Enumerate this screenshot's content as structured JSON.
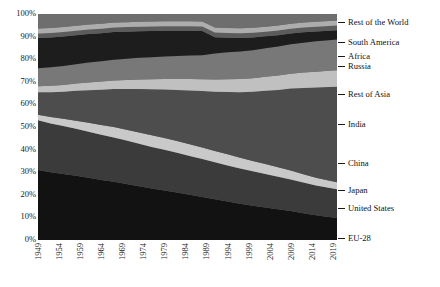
{
  "chart_data": {
    "type": "area",
    "title": "",
    "xlabel": "",
    "ylabel": "",
    "stacked": true,
    "normalized": true,
    "grid": false,
    "legend_position": "right-outside",
    "xlim": [
      1949,
      2020
    ],
    "ylim": [
      0,
      100
    ],
    "ytick_labels": [
      "100%",
      "90%",
      "80%",
      "70%",
      "60%",
      "50%",
      "40%",
      "30%",
      "20%",
      "10%",
      "0%"
    ],
    "ytick_values": [
      100,
      90,
      80,
      70,
      60,
      50,
      40,
      30,
      20,
      10,
      0
    ],
    "xtick_labels": [
      "1949",
      "1954",
      "1959",
      "1964",
      "1969",
      "1974",
      "1979",
      "1984",
      "1989",
      "1994",
      "1999",
      "2004",
      "2009",
      "2014",
      "2019"
    ],
    "xtick_values": [
      1949,
      1954,
      1959,
      1964,
      1969,
      1974,
      1979,
      1984,
      1989,
      1994,
      1999,
      2004,
      2009,
      2014,
      2019
    ],
    "x": [
      1949,
      1952,
      1955,
      1958,
      1961,
      1964,
      1967,
      1970,
      1973,
      1976,
      1979,
      1982,
      1985,
      1988,
      1991,
      1994,
      1997,
      2000,
      2003,
      2006,
      2009,
      2012,
      2015,
      2018,
      2020
    ],
    "series": [
      {
        "name": "EU-28",
        "color": "#121212",
        "legend_y": 238,
        "values": [
          31.0,
          30.0,
          29.2,
          28.4,
          27.5,
          26.6,
          25.8,
          24.8,
          23.8,
          22.8,
          21.9,
          21.0,
          20.0,
          19.0,
          18.0,
          17.0,
          16.0,
          15.2,
          14.4,
          13.6,
          12.8,
          11.8,
          10.9,
          10.2,
          9.8
        ]
      },
      {
        "name": "United States",
        "color": "#3b3b3b",
        "legend_y": 208,
        "values": [
          22.0,
          21.6,
          21.2,
          20.8,
          20.4,
          20.0,
          19.6,
          19.2,
          18.8,
          18.4,
          18.0,
          17.6,
          17.2,
          16.8,
          16.4,
          16.0,
          15.6,
          15.2,
          14.8,
          14.4,
          14.0,
          13.6,
          13.2,
          12.9,
          12.7
        ]
      },
      {
        "name": "Japan",
        "color": "#c9c9c9",
        "legend_y": 190,
        "values": [
          2.4,
          2.8,
          3.2,
          3.6,
          4.0,
          4.3,
          4.6,
          4.8,
          5.0,
          5.1,
          5.2,
          5.2,
          5.2,
          5.1,
          5.0,
          4.9,
          4.8,
          4.6,
          4.4,
          4.2,
          4.0,
          3.7,
          3.4,
          3.2,
          3.1
        ]
      },
      {
        "name": "China",
        "color": "#4d4d4d",
        "legend_y": 163,
        "values": [
          10.0,
          11.0,
          12.0,
          13.2,
          14.4,
          15.6,
          16.8,
          18.0,
          19.2,
          20.4,
          21.5,
          22.6,
          23.8,
          25.0,
          26.2,
          27.6,
          29.0,
          30.6,
          32.4,
          34.2,
          36.2,
          38.2,
          40.0,
          41.4,
          42.2
        ]
      },
      {
        "name": "India",
        "color": "#c0c0c0",
        "legend_y": 124,
        "values": [
          2.6,
          2.8,
          3.0,
          3.2,
          3.4,
          3.6,
          3.8,
          4.0,
          4.2,
          4.4,
          4.6,
          4.8,
          5.0,
          5.2,
          5.4,
          5.6,
          5.8,
          6.0,
          6.2,
          6.4,
          6.6,
          6.8,
          7.0,
          7.2,
          7.3
        ]
      },
      {
        "name": "Rest of Asia",
        "color": "#787878",
        "legend_y": 94,
        "values": [
          8.0,
          8.2,
          8.4,
          8.6,
          8.8,
          9.0,
          9.2,
          9.4,
          9.6,
          9.8,
          10.0,
          10.2,
          10.4,
          10.6,
          11.5,
          12.0,
          12.2,
          12.4,
          12.6,
          12.8,
          13.0,
          13.2,
          13.4,
          13.5,
          13.6
        ]
      },
      {
        "name": "Russia",
        "color": "#1d1d1d",
        "legend_y": 66,
        "values": [
          13.4,
          13.2,
          13.0,
          12.8,
          12.6,
          12.4,
          12.2,
          12.0,
          11.8,
          11.6,
          11.4,
          11.2,
          11.0,
          10.8,
          7.2,
          6.4,
          6.0,
          5.6,
          5.3,
          5.0,
          4.8,
          4.6,
          4.4,
          4.2,
          4.1
        ]
      },
      {
        "name": "Africa",
        "color": "#5c5c5c",
        "legend_y": 56,
        "values": [
          2.0,
          2.0,
          2.0,
          2.0,
          2.0,
          2.0,
          2.0,
          2.0,
          2.0,
          2.0,
          2.0,
          2.0,
          2.0,
          2.0,
          2.1,
          2.1,
          2.1,
          2.1,
          2.1,
          2.1,
          2.1,
          2.1,
          2.1,
          2.1,
          2.1
        ]
      },
      {
        "name": "South America",
        "color": "#adadad",
        "legend_y": 42,
        "values": [
          2.2,
          2.2,
          2.2,
          2.2,
          2.2,
          2.2,
          2.2,
          2.2,
          2.2,
          2.2,
          2.2,
          2.2,
          2.2,
          2.2,
          2.2,
          2.2,
          2.2,
          2.2,
          2.2,
          2.2,
          2.2,
          2.2,
          2.2,
          2.2,
          2.2
        ]
      },
      {
        "name": "Rest of the World",
        "color": "#6e6e6e",
        "legend_y": 22,
        "values": [
          6.4,
          6.2,
          5.8,
          5.2,
          4.7,
          4.3,
          3.8,
          3.6,
          3.4,
          3.3,
          3.2,
          3.2,
          3.2,
          3.3,
          6.0,
          6.2,
          6.3,
          6.1,
          5.6,
          5.1,
          4.3,
          3.8,
          3.4,
          3.1,
          2.9
        ]
      }
    ]
  }
}
